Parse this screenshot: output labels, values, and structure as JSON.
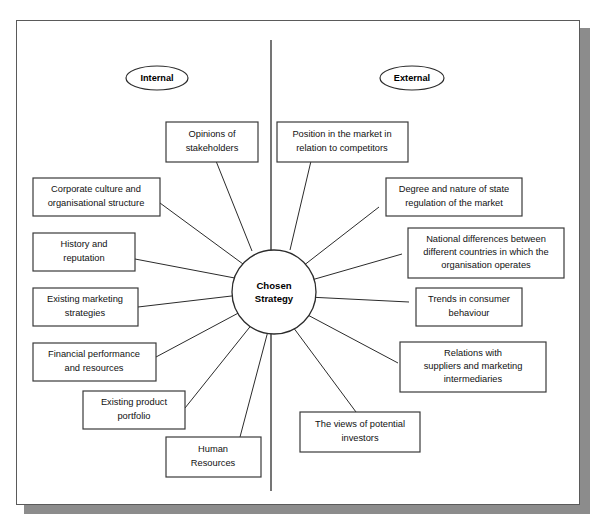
{
  "figure": {
    "hub": {
      "line1": "Chosen",
      "line2": "Strategy"
    },
    "side_labels": {
      "internal": "Internal",
      "external": "External"
    },
    "colors": {
      "page_background": "#ffffff",
      "frame_border": "#5a5a5a",
      "frame_shadow": "#8c8c8c",
      "line": "#2b2b2b",
      "box_border": "#3a3a3a",
      "text": "#111111"
    },
    "internal_factors": [
      {
        "id": "opinions-of-stakeholders",
        "lines": [
          "Opinions of",
          "stakeholders"
        ]
      },
      {
        "id": "corporate-culture",
        "lines": [
          "Corporate culture and",
          "organisational structure"
        ]
      },
      {
        "id": "history-and-reputation",
        "lines": [
          "History and",
          "reputation"
        ]
      },
      {
        "id": "existing-marketing-strategies",
        "lines": [
          "Existing marketing",
          "strategies"
        ]
      },
      {
        "id": "financial-performance",
        "lines": [
          "Financial performance",
          "and resources"
        ]
      },
      {
        "id": "existing-product-portfolio",
        "lines": [
          "Existing product",
          "portfolio"
        ]
      },
      {
        "id": "human-resources",
        "lines": [
          "Human",
          "Resources"
        ]
      }
    ],
    "external_factors": [
      {
        "id": "position-in-the-market",
        "lines": [
          "Position in the market in",
          "relation to competitors"
        ]
      },
      {
        "id": "state-regulation",
        "lines": [
          "Degree and nature of state",
          "regulation of the market"
        ]
      },
      {
        "id": "national-differences",
        "lines": [
          "National differences between",
          "different countries in which the",
          "organisation operates"
        ]
      },
      {
        "id": "consumer-trends",
        "lines": [
          "Trends in consumer",
          "behaviour"
        ]
      },
      {
        "id": "supplier-relations",
        "lines": [
          "Relations with",
          "suppliers and marketing",
          "intermediaries"
        ]
      },
      {
        "id": "potential-investors",
        "lines": [
          "The views of potential",
          "investors"
        ]
      }
    ]
  }
}
